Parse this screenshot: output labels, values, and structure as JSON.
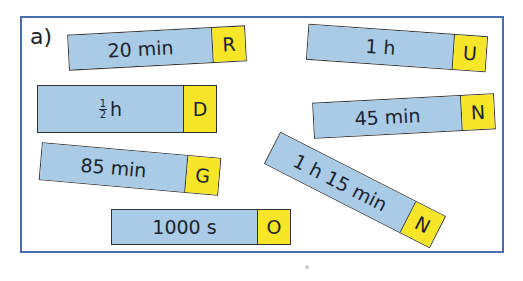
{
  "exercise": {
    "label": "a)",
    "colors": {
      "frame": "#4a6db0",
      "value_bg": "#a9cbe6",
      "letter_bg": "#f6e627"
    },
    "cards": [
      {
        "value": "20 min",
        "letter": "R"
      },
      {
        "value": "1 h",
        "letter": "U"
      },
      {
        "value_fraction": {
          "num": "1",
          "den": "2"
        },
        "value_unit": "h",
        "letter": "D"
      },
      {
        "value": "45 min",
        "letter": "N"
      },
      {
        "value": "85 min",
        "letter": "G"
      },
      {
        "value": "1 h 15 min",
        "letter": "N"
      },
      {
        "value": "1000 s",
        "letter": "O"
      }
    ]
  }
}
